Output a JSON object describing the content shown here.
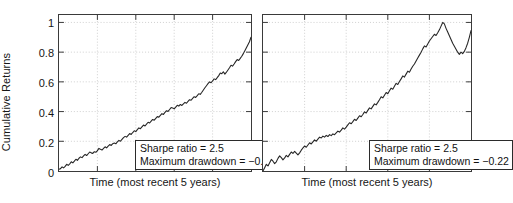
{
  "figure": {
    "background": "#ffffff",
    "line_color": "#262626",
    "grid_color": "#b9b9b9",
    "axis_color": "#3a3a3a"
  },
  "chart_data": [
    {
      "type": "line",
      "panel": "left",
      "title": "",
      "xlabel": "Time (most recent 5 years)",
      "ylabel": "Cumulative Returns",
      "ylim": [
        0,
        1.05
      ],
      "yticks": [
        0,
        0.2,
        0.4,
        0.6,
        0.8,
        1
      ],
      "ytick_labels": [
        "0",
        "0.2",
        "0.4",
        "0.6",
        "0.8",
        "1"
      ],
      "xlim": [
        0,
        1
      ],
      "xticks": [
        0.2,
        0.4,
        0.6,
        0.8
      ],
      "xtick_labels": [
        "",
        "",
        "",
        ""
      ],
      "grid": true,
      "legend": "none",
      "annotations": {
        "sharpe_ratio_label": "Sharpe ratio = 2.5",
        "max_drawdown_label": "Maximum drawdown = −0.057"
      },
      "series": [
        {
          "name": "Cumulative Returns",
          "x": [
            0,
            0.008,
            0.016,
            0.024,
            0.032,
            0.04,
            0.048,
            0.056,
            0.064,
            0.072,
            0.08,
            0.088,
            0.096,
            0.104,
            0.112,
            0.12,
            0.128,
            0.136,
            0.144,
            0.152,
            0.16,
            0.168,
            0.176,
            0.184,
            0.192,
            0.2,
            0.208,
            0.216,
            0.224,
            0.232,
            0.24,
            0.248,
            0.256,
            0.264,
            0.272,
            0.28,
            0.288,
            0.296,
            0.304,
            0.312,
            0.32,
            0.328,
            0.336,
            0.344,
            0.352,
            0.36,
            0.368,
            0.376,
            0.384,
            0.392,
            0.4,
            0.408,
            0.416,
            0.424,
            0.432,
            0.44,
            0.448,
            0.456,
            0.464,
            0.472,
            0.48,
            0.488,
            0.496,
            0.504,
            0.512,
            0.52,
            0.528,
            0.536,
            0.544,
            0.552,
            0.56,
            0.568,
            0.576,
            0.584,
            0.592,
            0.6,
            0.608,
            0.616,
            0.624,
            0.632,
            0.64,
            0.648,
            0.656,
            0.664,
            0.672,
            0.68,
            0.688,
            0.696,
            0.704,
            0.712,
            0.72,
            0.728,
            0.736,
            0.744,
            0.752,
            0.76,
            0.768,
            0.776,
            0.784,
            0.792,
            0.8,
            0.808,
            0.816,
            0.824,
            0.832,
            0.84,
            0.848,
            0.856,
            0.864,
            0.872,
            0.88,
            0.888,
            0.896,
            0.904,
            0.912,
            0.92,
            0.928,
            0.936,
            0.944,
            0.952,
            0.96,
            0.968,
            0.976,
            0.984,
            0.992,
            1
          ],
          "y": [
            0.012,
            0.016,
            0.028,
            0.021,
            0.031,
            0.045,
            0.038,
            0.048,
            0.062,
            0.055,
            0.066,
            0.079,
            0.072,
            0.086,
            0.095,
            0.09,
            0.101,
            0.112,
            0.104,
            0.116,
            0.128,
            0.122,
            0.118,
            0.13,
            0.126,
            0.137,
            0.152,
            0.146,
            0.141,
            0.152,
            0.163,
            0.156,
            0.168,
            0.178,
            0.172,
            0.184,
            0.188,
            0.183,
            0.196,
            0.206,
            0.2,
            0.213,
            0.225,
            0.233,
            0.228,
            0.24,
            0.252,
            0.246,
            0.259,
            0.271,
            0.265,
            0.278,
            0.29,
            0.285,
            0.297,
            0.309,
            0.303,
            0.316,
            0.328,
            0.323,
            0.335,
            0.347,
            0.342,
            0.354,
            0.366,
            0.362,
            0.374,
            0.386,
            0.381,
            0.394,
            0.406,
            0.401,
            0.414,
            0.427,
            0.424,
            0.418,
            0.43,
            0.442,
            0.437,
            0.448,
            0.441,
            0.452,
            0.462,
            0.456,
            0.468,
            0.48,
            0.476,
            0.489,
            0.5,
            0.495,
            0.507,
            0.52,
            0.516,
            0.53,
            0.545,
            0.56,
            0.574,
            0.588,
            0.6,
            0.594,
            0.606,
            0.62,
            0.615,
            0.628,
            0.642,
            0.66,
            0.655,
            0.668,
            0.652,
            0.665,
            0.68,
            0.695,
            0.712,
            0.706,
            0.72,
            0.736,
            0.75,
            0.744,
            0.758,
            0.772,
            0.79,
            0.81,
            0.83,
            0.85,
            0.87,
            0.9,
            0.94,
            1.0
          ]
        }
      ]
    },
    {
      "type": "line",
      "panel": "right",
      "title": "",
      "xlabel": "Time (most recent 5 years)",
      "ylabel": "",
      "ylim": [
        0,
        1.05
      ],
      "yticks": [
        0,
        0.2,
        0.4,
        0.6,
        0.8,
        1
      ],
      "ytick_labels": [
        "",
        "",
        "",
        "",
        "",
        ""
      ],
      "xlim": [
        0,
        1
      ],
      "xticks": [
        0.2,
        0.4,
        0.6,
        0.8
      ],
      "xtick_labels": [
        "",
        "",
        "",
        ""
      ],
      "grid": true,
      "legend": "none",
      "annotations": {
        "sharpe_ratio_label": "Sharpe ratio = 2.5",
        "max_drawdown_label": "Maximum drawdown = −0.22"
      },
      "series": [
        {
          "name": "Cumulative Returns",
          "x": [
            0,
            0.008,
            0.016,
            0.024,
            0.032,
            0.04,
            0.048,
            0.056,
            0.064,
            0.072,
            0.08,
            0.088,
            0.096,
            0.104,
            0.112,
            0.12,
            0.128,
            0.136,
            0.144,
            0.152,
            0.16,
            0.168,
            0.176,
            0.184,
            0.192,
            0.2,
            0.208,
            0.216,
            0.224,
            0.232,
            0.24,
            0.248,
            0.256,
            0.264,
            0.272,
            0.28,
            0.288,
            0.296,
            0.304,
            0.312,
            0.32,
            0.328,
            0.336,
            0.344,
            0.352,
            0.36,
            0.368,
            0.376,
            0.384,
            0.392,
            0.4,
            0.408,
            0.416,
            0.424,
            0.432,
            0.44,
            0.448,
            0.456,
            0.464,
            0.472,
            0.48,
            0.488,
            0.496,
            0.504,
            0.512,
            0.52,
            0.528,
            0.536,
            0.544,
            0.552,
            0.56,
            0.568,
            0.576,
            0.584,
            0.592,
            0.6,
            0.608,
            0.616,
            0.624,
            0.632,
            0.64,
            0.648,
            0.656,
            0.664,
            0.672,
            0.68,
            0.688,
            0.696,
            0.704,
            0.712,
            0.72,
            0.728,
            0.736,
            0.744,
            0.752,
            0.76,
            0.768,
            0.776,
            0.784,
            0.792,
            0.8,
            0.808,
            0.816,
            0.824,
            0.832,
            0.84,
            0.848,
            0.856,
            0.864,
            0.872,
            0.88,
            0.888,
            0.896,
            0.904,
            0.912,
            0.92,
            0.928,
            0.936,
            0.944,
            0.952,
            0.96,
            0.968,
            0.976,
            0.984,
            0.992,
            1
          ],
          "y": [
            0.0,
            0.022,
            0.045,
            0.034,
            0.056,
            0.078,
            0.066,
            0.05,
            0.062,
            0.085,
            0.102,
            0.09,
            0.075,
            0.088,
            0.105,
            0.095,
            0.112,
            0.128,
            0.118,
            0.132,
            0.12,
            0.108,
            0.122,
            0.14,
            0.155,
            0.168,
            0.16,
            0.175,
            0.19,
            0.182,
            0.196,
            0.21,
            0.2,
            0.215,
            0.228,
            0.222,
            0.235,
            0.228,
            0.24,
            0.232,
            0.245,
            0.238,
            0.25,
            0.244,
            0.256,
            0.268,
            0.262,
            0.275,
            0.29,
            0.282,
            0.295,
            0.31,
            0.325,
            0.318,
            0.332,
            0.348,
            0.34,
            0.356,
            0.372,
            0.365,
            0.38,
            0.398,
            0.39,
            0.408,
            0.425,
            0.418,
            0.435,
            0.452,
            0.445,
            0.462,
            0.48,
            0.5,
            0.492,
            0.51,
            0.528,
            0.52,
            0.54,
            0.558,
            0.55,
            0.57,
            0.59,
            0.582,
            0.602,
            0.62,
            0.64,
            0.632,
            0.652,
            0.672,
            0.665,
            0.686,
            0.705,
            0.72,
            0.74,
            0.76,
            0.78,
            0.8,
            0.822,
            0.842,
            0.835,
            0.855,
            0.875,
            0.89,
            0.905,
            0.92,
            0.912,
            0.93,
            0.95,
            0.975,
            1.0,
            0.99,
            0.96,
            0.935,
            0.91,
            0.885,
            0.86,
            0.84,
            0.82,
            0.8,
            0.785,
            0.8,
            0.79,
            0.805,
            0.83,
            0.86,
            0.9,
            0.945,
            0.975
          ]
        }
      ]
    }
  ]
}
